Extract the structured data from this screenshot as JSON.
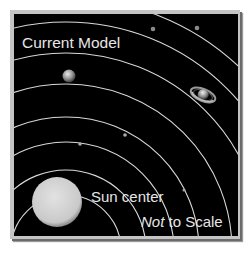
{
  "diagram": {
    "title": "Current Model",
    "sun_label": "Sun center",
    "scale_note": {
      "emphasis": "Not",
      "rest": " to Scale"
    },
    "colors": {
      "background": "#000000",
      "frame": "#c4c4c4",
      "orbit": "#d8d8d8",
      "text": "#e6e6e6",
      "sun": "#d0d0d0"
    },
    "bodies": [
      "sun",
      "mercury",
      "venus",
      "earth",
      "mars",
      "jupiter",
      "saturn",
      "uranus",
      "neptune"
    ]
  }
}
